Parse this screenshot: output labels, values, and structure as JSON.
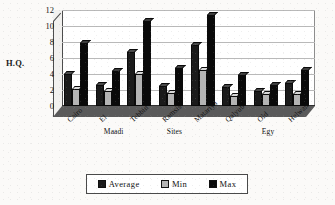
{
  "chart_data": {
    "type": "bar",
    "title": "",
    "xlabel": "",
    "ylabel": "H.Q.",
    "ylim": [
      0,
      12
    ],
    "yticks": [
      0,
      2,
      4,
      6,
      8,
      10,
      12
    ],
    "grid": true,
    "legend_position": "bottom",
    "categories": [
      "Cairo",
      "El Maadi",
      "Tebbin",
      "Ramsis Sites",
      "Matariya",
      "Qalyub",
      "Old Egy",
      "Helwan"
    ],
    "series": [
      {
        "name": "Average",
        "color": "#1b1b1b",
        "values": [
          4.0,
          2.6,
          6.7,
          2.5,
          7.6,
          2.4,
          1.9,
          2.9
        ]
      },
      {
        "name": "Min",
        "color": "#b4b4b4",
        "values": [
          2.1,
          1.9,
          4.0,
          1.6,
          4.5,
          1.3,
          1.5,
          1.5
        ]
      },
      {
        "name": "Max",
        "color": "#0a0a0a",
        "values": [
          7.9,
          4.4,
          10.6,
          4.8,
          11.4,
          3.9,
          2.6,
          4.5
        ]
      }
    ]
  },
  "axis": {
    "y_title": "H.Q."
  },
  "legend": {
    "items": [
      {
        "label": "Average",
        "key": "s-average"
      },
      {
        "label": "Min",
        "key": "s-min"
      },
      {
        "label": "Max",
        "key": "s-max"
      }
    ]
  }
}
